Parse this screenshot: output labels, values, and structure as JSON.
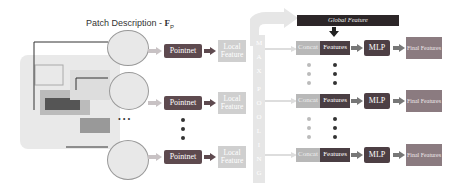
{
  "title": {
    "text": "Patch Description - ",
    "symbol": "F",
    "subscript": "P"
  },
  "global_feature": "Global Feature",
  "max_pooling_letters": [
    "M",
    "A",
    "X",
    "P",
    "O",
    "O",
    "L",
    "I",
    "N",
    "G"
  ],
  "rows": [
    {
      "pointnet": "Pointnet",
      "local": "Local Feature",
      "concat": "Concat",
      "features": "Features",
      "mlp": "MLP",
      "final": "Final Features"
    },
    {
      "pointnet": "Pointnet",
      "local": "Local Feature",
      "concat": "Concat",
      "features": "Features",
      "mlp": "MLP",
      "final": "Final Features"
    },
    {
      "pointnet": "Pointnet",
      "local": "Local Feature",
      "concat": "Concat",
      "features": "Features",
      "mlp": "MLP",
      "final": "Final Features"
    }
  ],
  "ellipsis": "• • •",
  "colors": {
    "pointnet": "#5e4a4f",
    "local": "#cfcfcf",
    "concat": "#b8b8b8",
    "features": "#4a3e43",
    "mlp": "#4d3f44",
    "final": "#8b7b80",
    "global": "#2c2628",
    "arrow": "#b8b0b2"
  }
}
